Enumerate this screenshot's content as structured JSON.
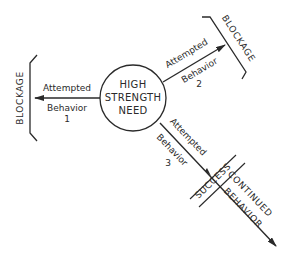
{
  "diagram": {
    "type": "need-behavior flow diagram",
    "center_node": {
      "lines": [
        "HIGH",
        "STRENGTH",
        "NEED"
      ]
    },
    "branches": [
      {
        "id": 1,
        "label_line1": "Attempted",
        "label_line2": "Behavior",
        "number": "1",
        "direction": "left",
        "outcome": "BLOCKAGE"
      },
      {
        "id": 2,
        "label_line1": "Attempted",
        "label_line2": "Behavior",
        "number": "2",
        "direction": "upper-right",
        "outcome": "BLOCKAGE"
      },
      {
        "id": 3,
        "label_line1": "Attempted",
        "label_line2": "Behavior",
        "number": "3",
        "direction": "lower-right",
        "outcome": "SUCCESS",
        "continuation_line1": "CONTINUED",
        "continuation_line2": "BEHAVIOR"
      }
    ],
    "colors": {
      "stroke": "#2a2a2a",
      "background": "#ffffff"
    }
  }
}
